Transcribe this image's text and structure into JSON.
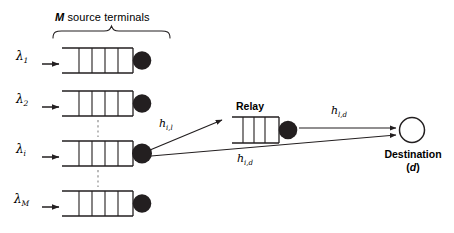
{
  "figure": {
    "title": "M source terminals",
    "title_italic_part": "M",
    "title_rest": " source terminals",
    "relay_label": "Relay",
    "destination_label": "Destination",
    "destination_sublabel_open": "(",
    "destination_sublabel_italic": "d",
    "destination_sublabel_close": ")",
    "colors": {
      "stroke": "#231f20",
      "fill_node": "#231f20",
      "background": "#ffffff",
      "dashed": "#8c8c8c"
    }
  },
  "arrival_rates": [
    {
      "name": "lambda-1",
      "symbol": "λ",
      "subscript": "1"
    },
    {
      "name": "lambda-2",
      "symbol": "λ",
      "subscript": "2"
    },
    {
      "name": "lambda-i",
      "symbol": "λ",
      "subscript": "i"
    },
    {
      "name": "lambda-M",
      "symbol": "λ",
      "subscript": "M"
    }
  ],
  "channels": [
    {
      "name": "h-i-l",
      "symbol": "h",
      "subscript": "i,l",
      "from": "source-i",
      "to": "relay"
    },
    {
      "name": "h-l-d",
      "symbol": "h",
      "subscript": "l,d",
      "from": "relay",
      "to": "destination"
    },
    {
      "name": "h-i-d",
      "symbol": "h",
      "subscript": "i,d",
      "from": "source-i",
      "to": "destination"
    }
  ],
  "queues": {
    "source_count_visible": 4,
    "cells_per_queue": 4,
    "relay_cells": 4
  }
}
